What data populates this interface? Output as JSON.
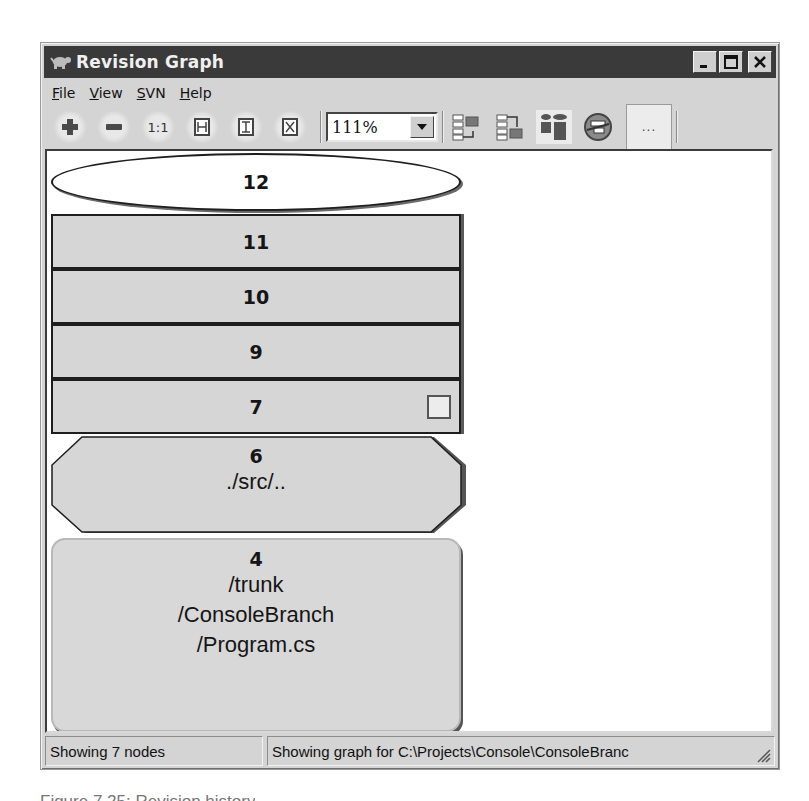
{
  "window": {
    "title": "Revision Graph",
    "icon": "tortoise-icon",
    "controls": {
      "minimize": "_",
      "maximize": "□",
      "close": "X"
    }
  },
  "menu": {
    "items": [
      {
        "label": "File",
        "accel": "F",
        "rest": "ile"
      },
      {
        "label": "View",
        "accel": "V",
        "rest": "iew"
      },
      {
        "label": "SVN",
        "accel": "S",
        "rest": "VN"
      },
      {
        "label": "Help",
        "accel": "H",
        "rest": "elp"
      }
    ]
  },
  "toolbar": {
    "zoom_in": "zoom-in-icon",
    "zoom_out": "zoom-out-icon",
    "zoom_100": "1:1",
    "zoom_fit_width": "fit-width-icon",
    "zoom_fit_height": "fit-height-icon",
    "zoom_fit_all": "fit-all-icon",
    "zoom_level": "111%",
    "group_branches": "group-branches-icon",
    "oldest_on_top": "oldest-on-top-icon",
    "align_trees": "align-trees-icon",
    "filter": "filter-icon",
    "more_label": "..."
  },
  "graph": {
    "nodes": [
      {
        "revision": "12",
        "shape": "ellipse",
        "kind": "head"
      },
      {
        "revision": "11",
        "shape": "rect",
        "kind": "modified"
      },
      {
        "revision": "10",
        "shape": "rect",
        "kind": "modified"
      },
      {
        "revision": "9",
        "shape": "rect",
        "kind": "modified"
      },
      {
        "revision": "7",
        "shape": "rect",
        "kind": "modified",
        "has_marker": true
      },
      {
        "revision": "6",
        "shape": "octagon",
        "kind": "renamed",
        "path": "./src/.."
      },
      {
        "revision": "4",
        "shape": "rounded-rect",
        "kind": "added",
        "path_lines": [
          "/trunk",
          "/ConsoleBranch",
          "/Program.cs"
        ]
      }
    ]
  },
  "status": {
    "left": "Showing 7 nodes",
    "right": "Showing graph for C:\\Projects\\Console\\ConsoleBranc"
  },
  "caption": "Figure 7.25: Revision history"
}
